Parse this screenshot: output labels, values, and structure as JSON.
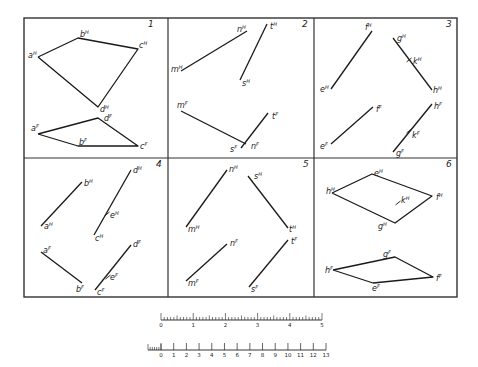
{
  "frame": {
    "x": 24,
    "y": 18,
    "width": 433,
    "height": 279,
    "mid_y": 158,
    "div_x": [
      168,
      314
    ],
    "stroke": "#333333"
  },
  "panels": [
    {
      "number": "1",
      "num_pos": [
        148,
        27
      ],
      "polylines": [
        {
          "name": "horizontal-projection-quadrilateral-abcd",
          "points": [
            [
              38,
              57
            ],
            [
              78,
              38
            ],
            [
              138,
              49
            ],
            [
              98,
              107
            ],
            [
              38,
              57
            ]
          ]
        },
        {
          "name": "frontal-projection-quadrilateral-abcd",
          "points": [
            [
              38,
              134
            ],
            [
              98,
              118
            ],
            [
              138,
              146
            ],
            [
              78,
              146
            ],
            [
              38,
              134
            ]
          ]
        }
      ],
      "labels": [
        {
          "text": "a",
          "sup": "H",
          "x": 28,
          "y": 58
        },
        {
          "text": "b",
          "sup": "H",
          "x": 80,
          "y": 37
        },
        {
          "text": "c",
          "sup": "H",
          "x": 139,
          "y": 48
        },
        {
          "text": "d",
          "sup": "H",
          "x": 100,
          "y": 112
        },
        {
          "text": "a",
          "sup": "F",
          "x": 31,
          "y": 131
        },
        {
          "text": "b",
          "sup": "F",
          "x": 79,
          "y": 145
        },
        {
          "text": "c",
          "sup": "F",
          "x": 140,
          "y": 149
        },
        {
          "text": "d",
          "sup": "F",
          "x": 104,
          "y": 121
        }
      ],
      "ticks": []
    },
    {
      "number": "2",
      "num_pos": [
        302,
        27
      ],
      "polylines": [
        {
          "name": "line-mn-horizontal",
          "points": [
            [
              181,
              71
            ],
            [
              247,
              31
            ]
          ]
        },
        {
          "name": "line-st-horizontal",
          "points": [
            [
              240,
              80
            ],
            [
              267,
              24
            ]
          ]
        },
        {
          "name": "line-mn-frontal",
          "points": [
            [
              181,
              111
            ],
            [
              246,
              144
            ]
          ]
        },
        {
          "name": "line-st-frontal",
          "points": [
            [
              241,
              148
            ],
            [
              268,
              113
            ]
          ]
        }
      ],
      "labels": [
        {
          "text": "m",
          "sup": "H",
          "x": 171,
          "y": 72
        },
        {
          "text": "n",
          "sup": "H",
          "x": 237,
          "y": 32
        },
        {
          "text": "t",
          "sup": "H",
          "x": 270,
          "y": 29
        },
        {
          "text": "s",
          "sup": "H",
          "x": 242,
          "y": 86
        },
        {
          "text": "m",
          "sup": "F",
          "x": 177,
          "y": 108
        },
        {
          "text": "t",
          "sup": "F",
          "x": 272,
          "y": 119
        },
        {
          "text": "s",
          "sup": "F",
          "x": 230,
          "y": 152
        },
        {
          "text": "n",
          "sup": "F",
          "x": 251,
          "y": 149
        }
      ],
      "ticks": []
    },
    {
      "number": "3",
      "num_pos": [
        446,
        27
      ],
      "polylines": [
        {
          "name": "line-ef-horizontal",
          "points": [
            [
              331,
              89
            ],
            [
              372,
              31
            ]
          ]
        },
        {
          "name": "line-gh-horizontal",
          "points": [
            [
              393,
              38
            ],
            [
              432,
              90
            ]
          ]
        },
        {
          "name": "line-ef-frontal",
          "points": [
            [
              331,
              144
            ],
            [
              373,
              107
            ]
          ]
        },
        {
          "name": "line-gh-frontal",
          "points": [
            [
              393,
              152
            ],
            [
              432,
              104
            ]
          ]
        }
      ],
      "labels": [
        {
          "text": "e",
          "sup": "H",
          "x": 320,
          "y": 92
        },
        {
          "text": "f",
          "sup": "H",
          "x": 365,
          "y": 30
        },
        {
          "text": "g",
          "sup": "H",
          "x": 397,
          "y": 41
        },
        {
          "text": "k",
          "sup": "H",
          "x": 413,
          "y": 64
        },
        {
          "text": "h",
          "sup": "H",
          "x": 433,
          "y": 93
        },
        {
          "text": "e",
          "sup": "F",
          "x": 320,
          "y": 149
        },
        {
          "text": "f",
          "sup": "F",
          "x": 376,
          "y": 112
        },
        {
          "text": "h",
          "sup": "F",
          "x": 434,
          "y": 109
        },
        {
          "text": "k",
          "sup": "F",
          "x": 412,
          "y": 138
        },
        {
          "text": "g",
          "sup": "F",
          "x": 396,
          "y": 156
        }
      ],
      "ticks": [
        [
          409,
          60
        ],
        [
          409,
          131
        ]
      ]
    },
    {
      "number": "4",
      "num_pos": [
        156,
        167
      ],
      "polylines": [
        {
          "name": "line-ab-horizontal",
          "points": [
            [
              41,
              226
            ],
            [
              82,
              182
            ]
          ]
        },
        {
          "name": "line-cd-horizontal",
          "points": [
            [
              94,
              235
            ],
            [
              131,
              170
            ]
          ]
        },
        {
          "name": "line-ab-frontal",
          "points": [
            [
              41,
              252
            ],
            [
              82,
              283
            ]
          ]
        },
        {
          "name": "line-cd-frontal",
          "points": [
            [
              95,
              290
            ],
            [
              131,
              245
            ]
          ]
        }
      ],
      "labels": [
        {
          "text": "b",
          "sup": "H",
          "x": 84,
          "y": 186
        },
        {
          "text": "a",
          "sup": "H",
          "x": 44,
          "y": 229
        },
        {
          "text": "d",
          "sup": "H",
          "x": 133,
          "y": 173
        },
        {
          "text": "e",
          "sup": "H",
          "x": 110,
          "y": 218
        },
        {
          "text": "c",
          "sup": "H",
          "x": 95,
          "y": 241
        },
        {
          "text": "a",
          "sup": "F",
          "x": 43,
          "y": 253
        },
        {
          "text": "b",
          "sup": "F",
          "x": 76,
          "y": 292
        },
        {
          "text": "d",
          "sup": "F",
          "x": 133,
          "y": 247
        },
        {
          "text": "e",
          "sup": "F",
          "x": 110,
          "y": 280
        },
        {
          "text": "c",
          "sup": "F",
          "x": 97,
          "y": 295
        }
      ],
      "ticks": [
        [
          107,
          214
        ],
        [
          108,
          277
        ]
      ]
    },
    {
      "number": "5",
      "num_pos": [
        303,
        167
      ],
      "polylines": [
        {
          "name": "line-mn-horizontal",
          "points": [
            [
              186,
              227
            ],
            [
              227,
              170
            ]
          ]
        },
        {
          "name": "line-st-horizontal",
          "points": [
            [
              248,
              176
            ],
            [
              288,
              228
            ]
          ]
        },
        {
          "name": "line-mn-frontal",
          "points": [
            [
              186,
              281
            ],
            [
              227,
              244
            ]
          ]
        },
        {
          "name": "line-st-frontal",
          "points": [
            [
              249,
              287
            ],
            [
              288,
              240
            ]
          ]
        }
      ],
      "labels": [
        {
          "text": "n",
          "sup": "H",
          "x": 229,
          "y": 172
        },
        {
          "text": "s",
          "sup": "H",
          "x": 254,
          "y": 179
        },
        {
          "text": "m",
          "sup": "H",
          "x": 188,
          "y": 232
        },
        {
          "text": "t",
          "sup": "H",
          "x": 289,
          "y": 232
        },
        {
          "text": "n",
          "sup": "F",
          "x": 230,
          "y": 246
        },
        {
          "text": "t",
          "sup": "F",
          "x": 291,
          "y": 244
        },
        {
          "text": "m",
          "sup": "F",
          "x": 188,
          "y": 286
        },
        {
          "text": "s",
          "sup": "F",
          "x": 251,
          "y": 292
        }
      ],
      "ticks": []
    },
    {
      "number": "6",
      "num_pos": [
        446,
        167
      ],
      "polylines": [
        {
          "name": "horizontal-projection-quadrilateral-efgh",
          "points": [
            [
              332,
              193
            ],
            [
              372,
              174
            ],
            [
              432,
              196
            ],
            [
              395,
              223
            ],
            [
              332,
              193
            ]
          ]
        },
        {
          "name": "frontal-projection-quadrilateral-efgh",
          "points": [
            [
              333,
              270
            ],
            [
              395,
              257
            ],
            [
              433,
              277
            ],
            [
              373,
              283
            ],
            [
              333,
              270
            ]
          ]
        }
      ],
      "labels": [
        {
          "text": "h",
          "sup": "H",
          "x": 326,
          "y": 194
        },
        {
          "text": "e",
          "sup": "H",
          "x": 374,
          "y": 176
        },
        {
          "text": "k",
          "sup": "H",
          "x": 401,
          "y": 203
        },
        {
          "text": "f",
          "sup": "H",
          "x": 436,
          "y": 200
        },
        {
          "text": "g",
          "sup": "H",
          "x": 378,
          "y": 229
        },
        {
          "text": "g",
          "sup": "F",
          "x": 383,
          "y": 257
        },
        {
          "text": "h",
          "sup": "F",
          "x": 325,
          "y": 273
        },
        {
          "text": "f",
          "sup": "F",
          "x": 436,
          "y": 281
        },
        {
          "text": "e",
          "sup": "F",
          "x": 372,
          "y": 291
        }
      ],
      "ticks": [
        [
          398,
          203
        ]
      ]
    }
  ],
  "scale_upper": {
    "x0": 161,
    "x1": 322,
    "y": 320,
    "labels": [
      "0",
      "1",
      "2",
      "3",
      "4",
      "5"
    ],
    "subdivisions": 10
  },
  "scale_lower": {
    "x0": 161,
    "x1": 326,
    "y": 350,
    "labels": [
      "0",
      "1",
      "2",
      "3",
      "4",
      "5",
      "6",
      "7",
      "8",
      "9",
      "10",
      "11",
      "12",
      "13"
    ],
    "lead_x0": 148,
    "lead_subdivisions": 6
  }
}
